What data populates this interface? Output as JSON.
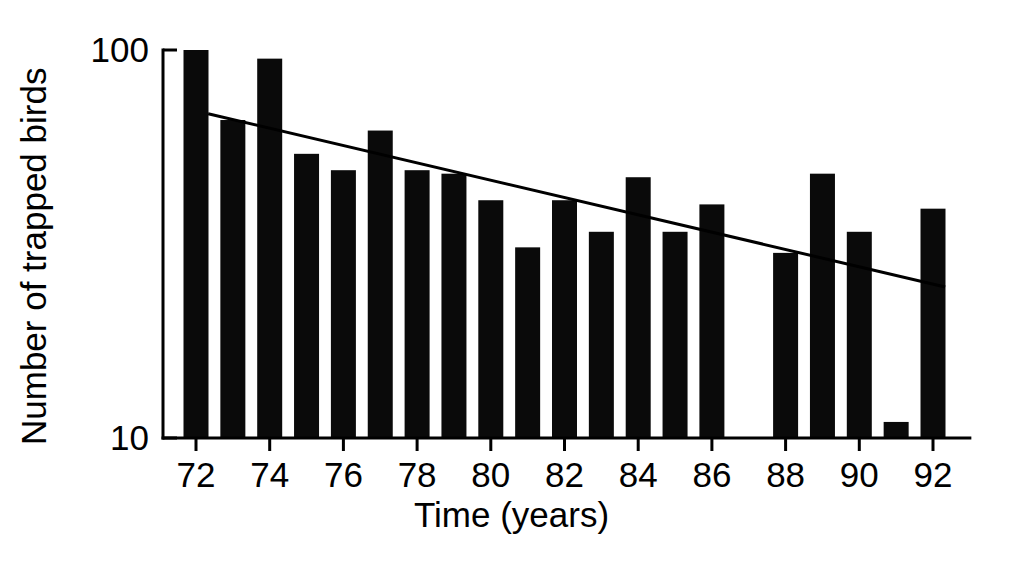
{
  "chart_data": {
    "type": "bar",
    "title": "",
    "xlabel": "Time (years)",
    "ylabel": "Number of trapped birds",
    "yscale": "log",
    "ylim": [
      10,
      100
    ],
    "ytick_labels": [
      "100",
      "10"
    ],
    "ytick_values": [
      100,
      10
    ],
    "xlim": [
      71.2,
      93.0
    ],
    "xtick_labels": [
      "72",
      "74",
      "76",
      "78",
      "80",
      "82",
      "84",
      "86",
      "88",
      "90",
      "92"
    ],
    "xtick_values": [
      72,
      74,
      76,
      78,
      80,
      82,
      84,
      86,
      88,
      90,
      92
    ],
    "grid": false,
    "legend": false,
    "categories": [
      72,
      73,
      74,
      75,
      76,
      77,
      78,
      79,
      80,
      81,
      82,
      83,
      84,
      85,
      86,
      87,
      88,
      89,
      90,
      91,
      92
    ],
    "values": [
      100,
      66,
      95,
      54,
      49,
      62,
      49,
      48,
      41,
      31,
      41,
      34,
      47,
      34,
      40,
      0,
      30,
      48,
      34,
      11,
      39
    ],
    "bar_color": "#0a0a0a",
    "series": [
      {
        "name": "Number of trapped birds",
        "values": [
          100,
          66,
          95,
          54,
          49,
          62,
          49,
          48,
          41,
          31,
          41,
          34,
          47,
          34,
          40,
          0,
          30,
          48,
          34,
          11,
          39
        ]
      }
    ],
    "annotations": [
      {
        "type": "trendline",
        "name": "declining-trend-line",
        "x_start": 72.33,
        "y_start": 68.5,
        "x_end": 92.33,
        "y_end": 24.5,
        "color": "#000000"
      }
    ]
  },
  "axes": {
    "x_title": "Time (years)",
    "y_title": "Number of trapped birds",
    "y_top_label": "100",
    "y_bottom_label": "10"
  }
}
